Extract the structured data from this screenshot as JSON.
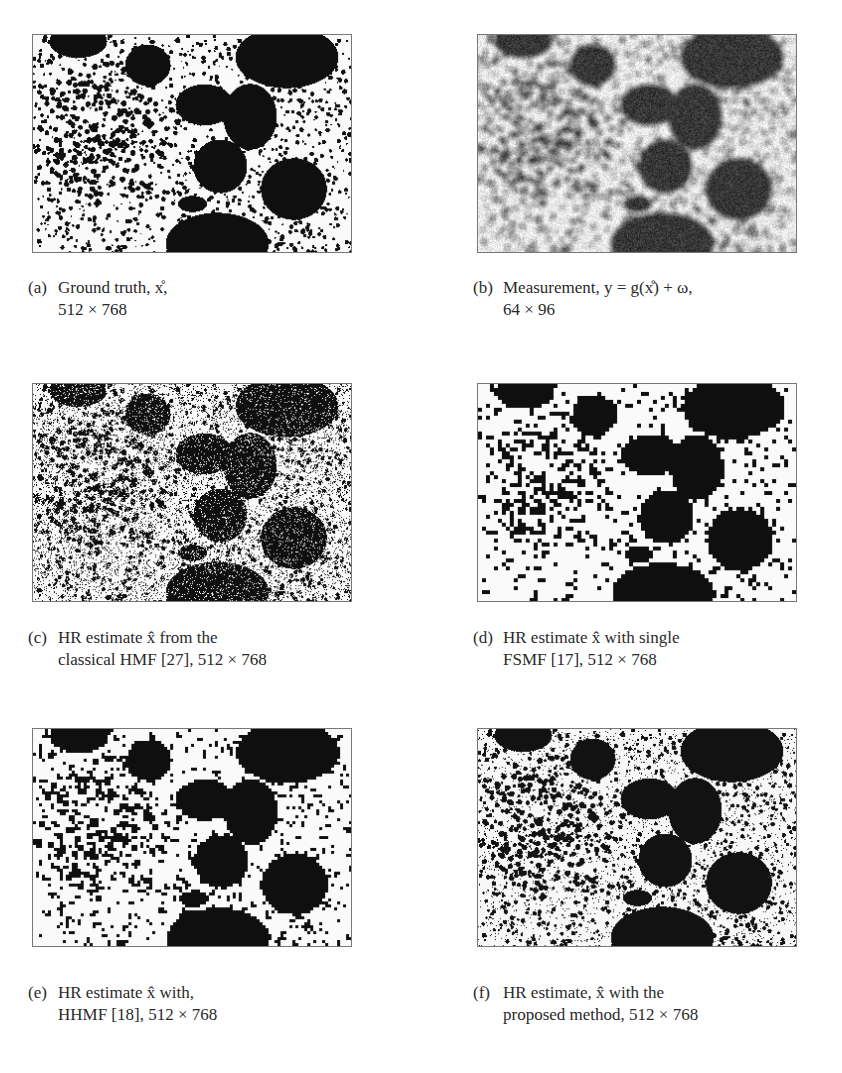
{
  "figure": {
    "panels": [
      {
        "id": "a",
        "label": "(a)",
        "caption_line1": "Ground truth, x̊,",
        "caption_line2": "512 × 768",
        "resolution": "512 × 768",
        "style": "sharp"
      },
      {
        "id": "b",
        "label": "(b)",
        "caption_line1": "Measurement, y = g(x̊) + ω,",
        "caption_line2": "64 × 96",
        "resolution": "64 × 96",
        "style": "blurred"
      },
      {
        "id": "c",
        "label": "(c)",
        "caption_line1": "HR estimate x̂ from the",
        "caption_line2": "classical HMF [27], 512 × 768",
        "resolution": "512 × 768",
        "style": "noisy"
      },
      {
        "id": "d",
        "label": "(d)",
        "caption_line1": "HR estimate x̂ with single",
        "caption_line2": "FSMF [17], 512 × 768",
        "resolution": "512 × 768",
        "style": "blocky"
      },
      {
        "id": "e",
        "label": "(e)",
        "caption_line1": "HR estimate x̂ with,",
        "caption_line2": "HHMF [18], 512 × 768",
        "resolution": "512 × 768",
        "style": "blocky-fine"
      },
      {
        "id": "f",
        "label": "(f)",
        "caption_line1": "HR estimate, x̂ with the",
        "caption_line2": "proposed method, 512 × 768",
        "resolution": "512 × 768",
        "style": "sharp-fine"
      }
    ]
  }
}
